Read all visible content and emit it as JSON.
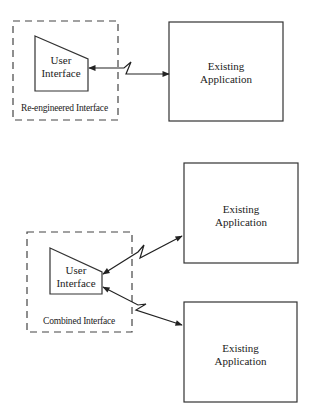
{
  "diagram": {
    "top": {
      "container_label": "Re-engineered Interface",
      "user_interface": {
        "line1": "User",
        "line2": "Interface"
      },
      "application": {
        "line1": "Existing",
        "line2": "Application"
      }
    },
    "bottom": {
      "container_label": "Combined Interface",
      "user_interface": {
        "line1": "User",
        "line2": "Interface"
      },
      "applications": [
        {
          "line1": "Existing",
          "line2": "Application"
        },
        {
          "line1": "Existing",
          "line2": "Application"
        }
      ]
    },
    "colors": {
      "stroke": "#333333",
      "background": "#ffffff"
    }
  }
}
